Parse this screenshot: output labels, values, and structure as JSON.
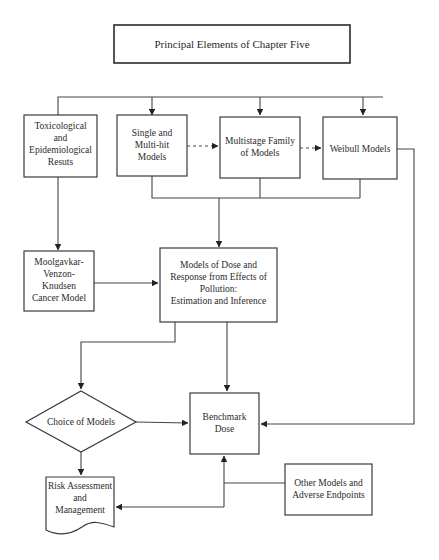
{
  "title": "Principal Elements of Chapter Five",
  "nodes": {
    "toxicological": {
      "lines": [
        "Toxicological",
        "and",
        "Epidemiological",
        "Resuts"
      ]
    },
    "single_multi_hit": {
      "lines": [
        "Single and",
        "Multi-hit",
        "Models"
      ]
    },
    "multistage": {
      "lines": [
        "Multistage Family",
        "of Models"
      ]
    },
    "weibull": {
      "lines": [
        "Weibull Models"
      ]
    },
    "mvk": {
      "lines": [
        "Moolgavkar-",
        "Venzon-",
        "Knudsen",
        "Cancer Model"
      ]
    },
    "dose_response": {
      "lines": [
        "Models of Dose and",
        "Response from Effects of",
        "Pollution:",
        "Estimation and Inference"
      ]
    },
    "choice": {
      "lines": [
        "Choice of Models"
      ]
    },
    "benchmark": {
      "lines": [
        "Benchmark",
        "Dose"
      ]
    },
    "risk": {
      "lines": [
        "Risk Assessment",
        "and",
        "Management"
      ]
    },
    "other": {
      "lines": [
        "Other Models and",
        "Adverse Endpoints"
      ]
    }
  },
  "colors": {
    "stroke": "#3a3a3a",
    "text": "#2a2a2a",
    "background": "#ffffff"
  }
}
